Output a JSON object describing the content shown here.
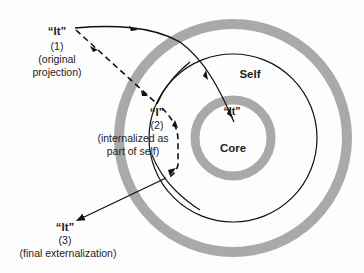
{
  "diagram": {
    "labels": {
      "self": "Self",
      "core": "Core",
      "it_core": "“It”",
      "it1": {
        "name": "“It”",
        "num": "(1)",
        "desc1": "(original",
        "desc2": "projection)"
      },
      "i2": {
        "name": "“I”",
        "num": "(2)",
        "desc1": "(internalized as",
        "desc2": "part of self)"
      },
      "it3": {
        "name": "“It”",
        "num": "(3)",
        "desc1": "(final externalization)"
      }
    },
    "colors": {
      "ring_gray": "#a9a9a9",
      "line": "#111111",
      "background": "#fdfdfd"
    }
  }
}
